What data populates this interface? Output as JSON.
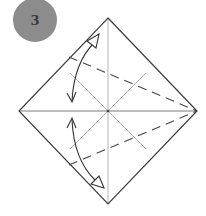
{
  "step": {
    "number": "3",
    "badge_color": "#8c8c8c",
    "number_color": "#3c3c3c"
  },
  "diagram": {
    "type": "origami-fold-instruction",
    "paper_shape": "square-rotated-45",
    "vertices": {
      "top": [
        108,
        18
      ],
      "right": [
        197,
        111
      ],
      "bottom": [
        108,
        204
      ],
      "left": [
        19,
        111
      ]
    },
    "center": [
      108,
      111
    ],
    "outline_color": "#3a3a3a",
    "crease_color": "#b0b0b0",
    "fold_line_color": "#444444",
    "arrow_color": "#333333",
    "creases": [
      "vertical",
      "horizontal",
      "diagonal-short-1",
      "diagonal-short-2"
    ],
    "valley_folds": [
      {
        "from": [
          69,
          57
        ],
        "to": [
          197,
          111
        ]
      },
      {
        "from": [
          69,
          165
        ],
        "to": [
          197,
          111
        ]
      }
    ],
    "arrows": [
      {
        "name": "fold-and-unfold-upper",
        "from": [
          72,
          102
        ],
        "to": [
          97,
          37
        ]
      },
      {
        "name": "fold-and-unfold-lower",
        "from": [
          72,
          118
        ],
        "to": [
          101,
          187
        ]
      }
    ]
  }
}
